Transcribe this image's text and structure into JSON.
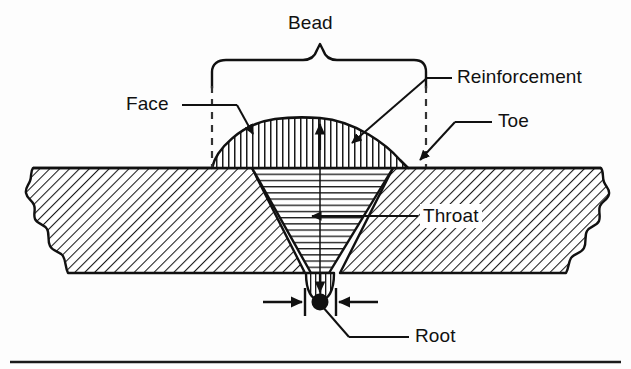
{
  "figure": {
    "type": "technical-cross-section-diagram",
    "line_color": "#111111",
    "fill_color": "#ffffff",
    "background_color": "#fdfdfd"
  },
  "labels": {
    "bead": "Bead",
    "face": "Face",
    "reinforcement": "Reinforcement",
    "toe": "Toe",
    "throat": "Throat",
    "root": "Root"
  },
  "annotations": {
    "bead_brace": "curly-brace spanning full bead width",
    "face_leader": "leader line with arrowhead to bead outer surface",
    "reinforcement_leader": "leader line with arrowhead into bead crown",
    "toe_leader": "leader line with arrowhead to bead edge at plate surface",
    "throat_leader": "leader line with arrowhead into weld groove",
    "root_leader": "leader line from root dot",
    "root_dimension": "inward dimension arrows at root opening",
    "center_line": "vertical centerline through weld",
    "reinforcement_height_arrow": "up arrow on centerline in bead"
  },
  "regions": {
    "base_metal": "diagonal hatch, broken (wavy) edges left and right",
    "weld_groove": "horizontal hatch inside V-groove",
    "bead_crown": "vertical hatch dome above plate surface",
    "root_penetration": "vertical hatch bulge below plate surface"
  }
}
